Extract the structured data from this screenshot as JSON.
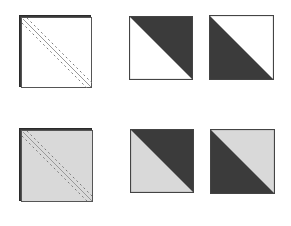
{
  "diagram": {
    "colors": {
      "dark": "#3b3b3b",
      "light": "#d9d9d9",
      "white": "#ffffff",
      "stitch": "#7a7a7a",
      "edge": "#2a2a2a"
    },
    "rows": [
      {
        "name": "row-white",
        "fabric_light": "#ffffff",
        "stitched_square": {
          "x": 19,
          "y": 15,
          "size": 72,
          "label": "stitched-square"
        },
        "units": [
          {
            "x": 129,
            "y": 16,
            "size": 64,
            "dark_half": "top-right",
            "label": "hst-unit-1"
          },
          {
            "x": 209,
            "y": 15,
            "size": 65,
            "dark_half": "bottom-left",
            "label": "hst-unit-2"
          }
        ]
      },
      {
        "name": "row-gray",
        "fabric_light": "#d9d9d9",
        "stitched_square": {
          "x": 19,
          "y": 128,
          "size": 73,
          "label": "stitched-square"
        },
        "units": [
          {
            "x": 130,
            "y": 129,
            "size": 64,
            "dark_half": "top-right",
            "label": "hst-unit-1"
          },
          {
            "x": 210,
            "y": 129,
            "size": 65,
            "dark_half": "bottom-left",
            "label": "hst-unit-2"
          }
        ]
      }
    ]
  }
}
